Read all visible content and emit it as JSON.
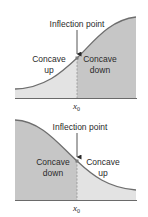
{
  "colors": {
    "light_fill": "#e3e3e3",
    "dark_fill": "#c6c6c6",
    "curve": "#6e6e6e",
    "axis": "#6a6a6a",
    "text": "#2a2a2a",
    "dashed_line": "#8a8a8a",
    "point": "#7a7a7a"
  },
  "panels": [
    {
      "id": "top",
      "annotation": "Inflection point",
      "left_region": {
        "line1": "Concave",
        "line2": "up"
      },
      "right_region": {
        "line1": "Concave",
        "line2": "down"
      },
      "x_label": "x",
      "x_subscript": "0"
    },
    {
      "id": "bottom",
      "annotation": "Inflection point",
      "left_region": {
        "line1": "Concave",
        "line2": "down"
      },
      "right_region": {
        "line1": "Concave",
        "line2": "up"
      },
      "x_label": "x",
      "x_subscript": "0"
    }
  ]
}
